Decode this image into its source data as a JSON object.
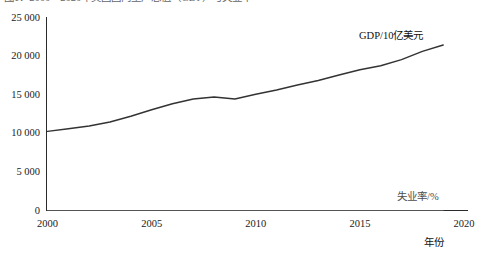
{
  "caption": {
    "text": "图1：2000～2020年美国国内生产总值（GDP）与失业率"
  },
  "chart_data": {
    "type": "line",
    "title": "",
    "xlabel": "年份",
    "ylabel": "",
    "xlim": [
      2000,
      2020
    ],
    "ylim": [
      0,
      25000
    ],
    "grid": false,
    "legend_position": "inline-annotation",
    "xticks": [
      2000,
      2005,
      2010,
      2015,
      2020
    ],
    "xticklabels": [
      "2000",
      "2005",
      "2010",
      "2015",
      "2020"
    ],
    "yticks": [
      0,
      5000,
      10000,
      15000,
      20000,
      25000
    ],
    "yticklabels": [
      "0",
      "5 000",
      "10 000",
      "15 000",
      "20 000",
      "25 000"
    ],
    "x": [
      2000,
      2001,
      2002,
      2003,
      2004,
      2005,
      2006,
      2007,
      2008,
      2009,
      2010,
      2011,
      2012,
      2013,
      2014,
      2015,
      2016,
      2017,
      2018,
      2019
    ],
    "series": [
      {
        "name": "GDP/10亿美元",
        "unit": "10亿美元",
        "color": "#333333",
        "values": [
          10250,
          10580,
          10940,
          11460,
          12210,
          13040,
          13820,
          14450,
          14710,
          14450,
          15050,
          15600,
          16250,
          16840,
          17550,
          18240,
          18750,
          19540,
          20610,
          21430
        ]
      },
      {
        "name": "失业率/%",
        "unit": "%",
        "color": "#555555",
        "values": [
          4.0,
          4.7,
          5.8,
          6.0,
          5.5,
          5.1,
          4.6,
          4.6,
          5.8,
          9.3,
          9.6,
          8.9,
          8.1,
          7.4,
          6.2,
          5.3,
          4.9,
          4.4,
          3.9,
          3.7
        ]
      }
    ]
  },
  "axis": {
    "x_title": "年份"
  }
}
